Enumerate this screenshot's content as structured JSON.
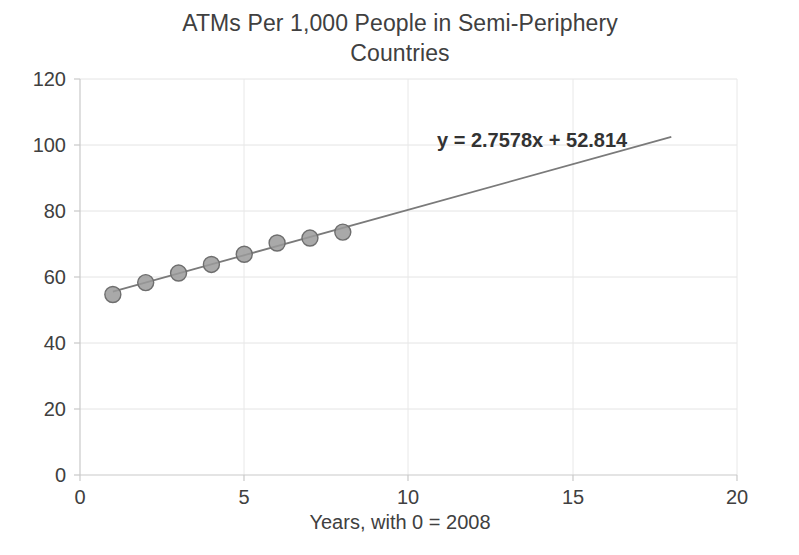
{
  "chart_data": {
    "type": "scatter",
    "title": "ATMs Per 1,000 People in Semi-Periphery Countries",
    "title_line_1": "ATMs Per 1,000 People in Semi-Periphery",
    "title_line_2": "Countries",
    "xlabel": "Years, with 0 = 2008",
    "ylabel": "",
    "xlim": [
      0,
      20
    ],
    "ylim": [
      0,
      120
    ],
    "xticks": [
      0,
      5,
      10,
      15,
      20
    ],
    "yticks": [
      0,
      20,
      40,
      60,
      80,
      100,
      120
    ],
    "xtick_labels": [
      "0",
      "5",
      "10",
      "15",
      "20"
    ],
    "ytick_labels": [
      "0",
      "20",
      "40",
      "60",
      "80",
      "100",
      "120"
    ],
    "grid": true,
    "legend": "none",
    "x": [
      1,
      2,
      3,
      4,
      5,
      6,
      7,
      8
    ],
    "values": [
      54.7,
      58.3,
      61.2,
      63.8,
      66.9,
      70.3,
      71.8,
      73.6
    ],
    "series": [
      {
        "name": "ATMs per 1,000 people",
        "x": [
          1,
          2,
          3,
          4,
          5,
          6,
          7,
          8
        ],
        "values": [
          54.7,
          58.3,
          61.2,
          63.8,
          66.9,
          70.3,
          71.8,
          73.6
        ]
      }
    ],
    "trendline": {
      "equation": "y = 2.7578x + 52.814",
      "slope": 2.7578,
      "intercept": 52.814,
      "x_start": 1,
      "x_end": 18
    },
    "annotations": [
      {
        "text": "y = 2.7578x + 52.814"
      }
    ],
    "colors": {
      "marker_fill": "#9a9a9a",
      "marker_stroke": "#6e6e6e",
      "trendline": "#7a7a7a",
      "gridline": "#e2e2e2",
      "axis": "#d0d0d0",
      "text": "#404040"
    }
  }
}
